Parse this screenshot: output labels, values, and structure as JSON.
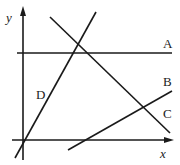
{
  "diagram": {
    "axes": {
      "x_label": "x",
      "y_label": "y"
    },
    "lines": [
      {
        "label": "A",
        "x1": 17,
        "y1": 53,
        "x2": 172,
        "y2": 53
      },
      {
        "label": "B",
        "x1": 68,
        "y1": 150,
        "x2": 172,
        "y2": 91
      },
      {
        "label": "C",
        "x1": 50,
        "y1": 17,
        "x2": 170,
        "y2": 133
      },
      {
        "label": "D",
        "x1": 15,
        "y1": 158,
        "x2": 96,
        "y2": 12
      }
    ],
    "color": "#1a1a1a"
  }
}
